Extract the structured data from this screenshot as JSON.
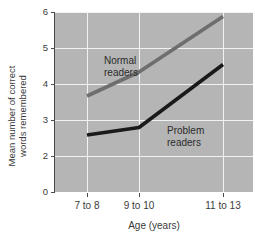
{
  "chart_data": {
    "type": "line",
    "title": "",
    "xlabel": "Age (years)",
    "ylabel": "Mean number of correct words remembered",
    "ylabel_line1": "Mean number of correct",
    "ylabel_line2": "words remembered",
    "categories": [
      "7 to 8",
      "9 to 10",
      "11 to 13"
    ],
    "yticks": [
      "6",
      "5",
      "4",
      "3",
      "2",
      "0"
    ],
    "ytick_values": [
      6,
      5,
      4,
      3,
      2,
      0
    ],
    "ylim": [
      0,
      6
    ],
    "grid": true,
    "legend_position": "inline-annotations",
    "series": [
      {
        "name": "Normal readers",
        "label_line1": "Normal",
        "label_line2": "readers",
        "color": "#6e6e6e",
        "values": [
          3.2,
          4.0,
          5.85
        ]
      },
      {
        "name": "Problem readers",
        "label_line1": "Problem",
        "label_line2": "readers",
        "color": "#1a1a1a",
        "values": [
          1.9,
          2.15,
          4.25
        ]
      }
    ],
    "plot_background": "#b5b5b5",
    "gridline_color": "#f2f2f2",
    "axis_color": "#4a4a4a",
    "note_axis_break": "y-axis label 1 is omitted between 2 and 0"
  }
}
